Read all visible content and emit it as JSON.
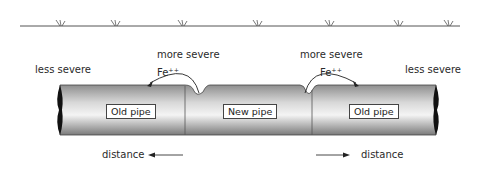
{
  "diagram": {
    "ground_line": {
      "grass_marks": 7
    },
    "pipes": [
      {
        "label": "Old pipe"
      },
      {
        "label": "New pipe"
      },
      {
        "label": "Old pipe"
      }
    ],
    "labels": {
      "less_severe_left": "less severe",
      "less_severe_right": "less severe",
      "more_severe_left": "more severe",
      "more_severe_right": "more severe",
      "ion_left": "Fe⁺⁺",
      "ion_right": "Fe⁺⁺",
      "distance_left": "distance",
      "distance_right": "distance"
    },
    "colors": {
      "line": "#333333",
      "pipe_light": "#f2f2f2",
      "pipe_dark": "#8a8a8a"
    }
  }
}
